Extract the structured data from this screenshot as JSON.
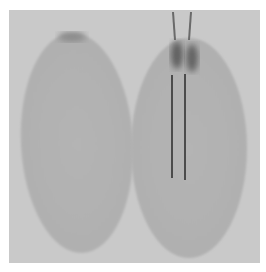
{
  "image": {
    "description": "Grayscale photograph of two oval seeds side by side; the right seed has two thin vertical probes/electrodes inserted from the top",
    "colors": {
      "background": "#c9c9c9",
      "seed": "#b2b2b2",
      "seed_edge": "#a6a6a6",
      "probe": "#2a2a2a",
      "dark_spot": "#6e6e6e"
    },
    "objects": [
      {
        "name": "left-seed"
      },
      {
        "name": "right-seed"
      },
      {
        "name": "probe-left"
      },
      {
        "name": "probe-right"
      }
    ]
  }
}
